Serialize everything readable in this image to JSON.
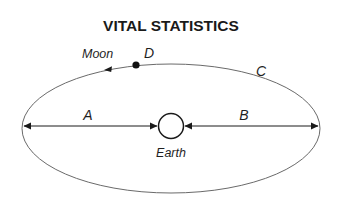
{
  "title": "VITAL STATISTICS",
  "labels": {
    "moon": "Moon",
    "d": "D",
    "c": "C",
    "a": "A",
    "b": "B",
    "earth": "Earth"
  },
  "colors": {
    "orbit": "#6a6a6a",
    "ink": "#1a1a1a",
    "background": "#ffffff"
  }
}
